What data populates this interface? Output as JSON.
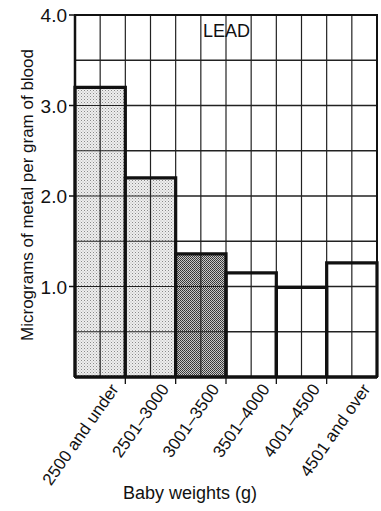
{
  "chart_data": {
    "type": "bar",
    "title": "LEAD",
    "xlabel": "Baby weights (g)",
    "ylabel": "Micrograms of metal per gram of blood",
    "ylim": [
      0,
      4.0
    ],
    "yticks": [
      "1.0",
      "2.0",
      "3.0",
      "4.0"
    ],
    "grid": true,
    "categories": [
      "2500 and under",
      "2501–3000",
      "3001–3500",
      "3501–4000",
      "4001–4500",
      "4501 and over"
    ],
    "values": [
      3.2,
      2.2,
      1.36,
      1.15,
      0.99,
      1.26
    ],
    "bar_fills": [
      "light-stipple",
      "light-stipple",
      "dark-stipple",
      "white",
      "white",
      "white"
    ]
  },
  "colors": {
    "light_stipple": "#e4e4e4",
    "dark_stipple": "#9a9a9a",
    "white": "#ffffff",
    "ink": "#111111"
  }
}
